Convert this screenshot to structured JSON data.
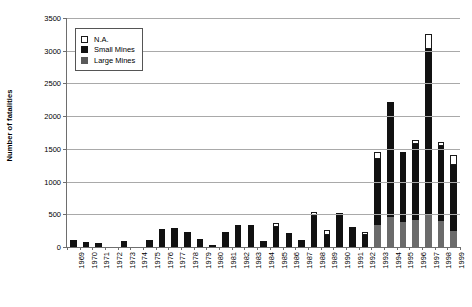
{
  "chart_data": {
    "type": "bar",
    "stacked": true,
    "title": "",
    "xlabel": "",
    "ylabel": "Number of fatalities",
    "ylim": [
      0,
      3500
    ],
    "ytick_step": 500,
    "yticks": [
      0,
      500,
      1000,
      1500,
      2000,
      2500,
      3000,
      3500
    ],
    "grid": true,
    "legend_position": "top-left",
    "legend": [
      "N.A.",
      "Small Mines",
      "Large Mines"
    ],
    "categories": [
      "1969",
      "1970",
      "1971",
      "1972",
      "1973",
      "1974",
      "1975",
      "1976",
      "1977",
      "1978",
      "1979",
      "1980",
      "1981",
      "1982",
      "1983",
      "1984",
      "1985",
      "1986",
      "1987",
      "1988",
      "1989",
      "1990",
      "1991",
      "1992",
      "1993",
      "1994",
      "1995",
      "1996",
      "1997",
      "1998",
      "1999"
    ],
    "series": [
      {
        "name": "Large Mines",
        "color": "#6b6b6b",
        "values": [
          0,
          0,
          0,
          0,
          0,
          0,
          0,
          0,
          0,
          0,
          0,
          0,
          0,
          0,
          0,
          0,
          0,
          0,
          0,
          0,
          0,
          0,
          0,
          0,
          330,
          460,
          380,
          420,
          500,
          400,
          250
        ]
      },
      {
        "name": "Small Mines",
        "color": "#111111",
        "values": [
          110,
          70,
          60,
          0,
          90,
          0,
          110,
          280,
          285,
          230,
          120,
          35,
          225,
          340,
          335,
          90,
          300,
          215,
          100,
          480,
          190,
          520,
          300,
          180,
          1020,
          1750,
          1070,
          1150,
          2520,
          1150,
          1000
        ]
      },
      {
        "name": "N.A.",
        "color": "#ffffff",
        "values": [
          0,
          0,
          0,
          0,
          0,
          0,
          0,
          0,
          0,
          0,
          0,
          0,
          0,
          0,
          0,
          0,
          60,
          0,
          0,
          60,
          70,
          0,
          0,
          50,
          100,
          0,
          0,
          70,
          240,
          60,
          160
        ]
      }
    ],
    "totals": [
      110,
      70,
      60,
      0,
      90,
      0,
      110,
      280,
      285,
      230,
      120,
      35,
      225,
      340,
      335,
      90,
      360,
      215,
      100,
      540,
      260,
      520,
      300,
      230,
      1450,
      2210,
      1450,
      1640,
      3260,
      1610,
      1410
    ]
  }
}
